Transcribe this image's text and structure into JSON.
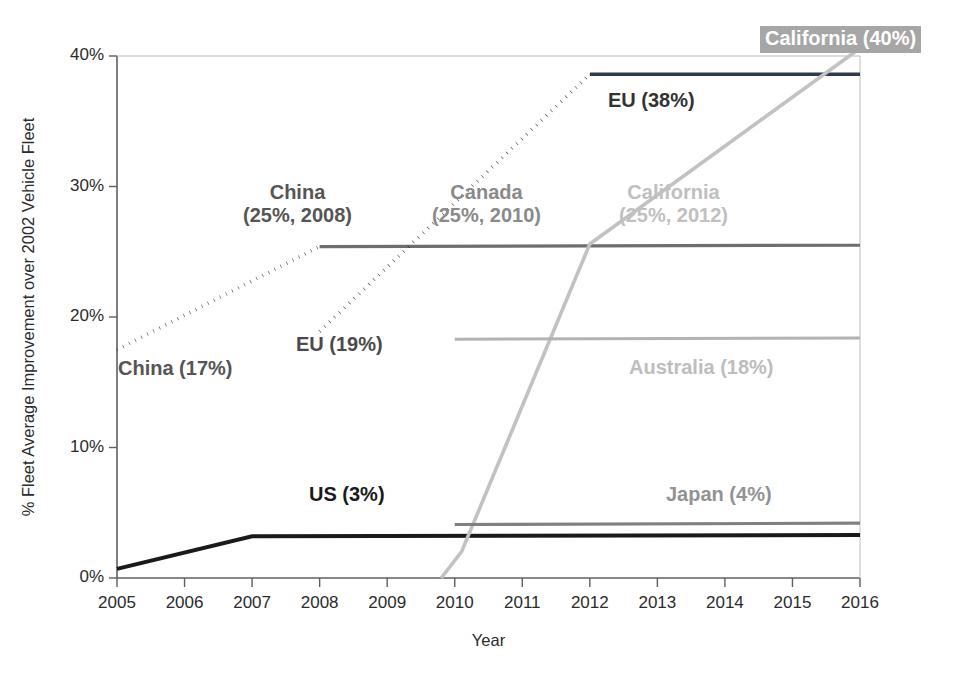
{
  "chart_data": {
    "type": "line",
    "title": "",
    "xlabel": "Year",
    "ylabel": "% Fleet Average Improvement over 2002 Vehicle Fleet",
    "xlim": [
      2005,
      2016
    ],
    "ylim": [
      0,
      40
    ],
    "grid": false,
    "legend": "none (in-plot annotations)",
    "xticks": [
      "2005",
      "2006",
      "2007",
      "2008",
      "2009",
      "2010",
      "2011",
      "2012",
      "2013",
      "2014",
      "2015",
      "2016"
    ],
    "yticks": [
      "0%",
      "10%",
      "20%",
      "30%",
      "40%"
    ],
    "series": [
      {
        "name": "US",
        "style": "solid",
        "color": "#1a1a1a",
        "width": 4.0,
        "x": [
          2005,
          2007,
          2016
        ],
        "values": [
          0.7,
          3.2,
          3.3
        ]
      },
      {
        "name": "China",
        "style": "dotted",
        "color": "#4d4d4d",
        "width": 3.6,
        "x": [
          2005,
          2008
        ],
        "values": [
          17.5,
          25.4
        ]
      },
      {
        "name": "Canada",
        "style": "solid",
        "color": "#6e6e6e",
        "width": 3.2,
        "x": [
          2008,
          2016
        ],
        "values": [
          25.4,
          25.5
        ]
      },
      {
        "name": "EU",
        "style": "dotted",
        "color": "#3a3a3a",
        "width": 3.6,
        "x": [
          2008,
          2012
        ],
        "values": [
          18.9,
          38.6
        ]
      },
      {
        "name": "EU plateau",
        "style": "solid",
        "color": "#2f3a4a",
        "width": 3.4,
        "x": [
          2012,
          2016
        ],
        "values": [
          38.6,
          38.6
        ]
      },
      {
        "name": "California",
        "style": "solid",
        "color": "#c2c2c2",
        "width": 3.6,
        "x": [
          2009.8,
          2010.1,
          2012,
          2016
        ],
        "values": [
          0.0,
          2.0,
          25.6,
          40.6
        ]
      },
      {
        "name": "Australia",
        "style": "solid",
        "color": "#b3b3b3",
        "width": 3.0,
        "x": [
          2010,
          2016
        ],
        "values": [
          18.3,
          18.4
        ]
      },
      {
        "name": "Japan",
        "style": "solid",
        "color": "#808080",
        "width": 3.2,
        "x": [
          2010,
          2016
        ],
        "values": [
          4.1,
          4.2
        ]
      }
    ],
    "annotations": [
      {
        "id": "china_start",
        "text": "China (17%)",
        "color": "#555555"
      },
      {
        "id": "china_target_l1",
        "text": "China",
        "color": "#555555"
      },
      {
        "id": "china_target_l2",
        "text": "(25%, 2008)",
        "color": "#555555"
      },
      {
        "id": "canada_target_l1",
        "text": "Canada",
        "color": "#8a8a8a"
      },
      {
        "id": "canada_target_l2",
        "text": "(25%, 2010)",
        "color": "#8a8a8a"
      },
      {
        "id": "california_target_l1",
        "text": "California",
        "color": "#c0c0c0"
      },
      {
        "id": "california_target_l2",
        "text": "(25%, 2012)",
        "color": "#c0c0c0"
      },
      {
        "id": "california_final",
        "text": "California (40%)",
        "color": "#ffffff"
      },
      {
        "id": "eu_final",
        "text": "EU (38%)",
        "color": "#333333"
      },
      {
        "id": "eu_start",
        "text": "EU (19%)",
        "color": "#4a4a4a"
      },
      {
        "id": "australia_final",
        "text": "Australia (18%)",
        "color": "#bdbdbd"
      },
      {
        "id": "us_final",
        "text": "US (3%)",
        "color": "#1a1a1a"
      },
      {
        "id": "japan_final",
        "text": "Japan (4%)",
        "color": "#929292"
      }
    ],
    "colors": {
      "background": "#ffffff",
      "axis": "#5f5f5f",
      "highlight_box": "#a6a6a6"
    }
  }
}
